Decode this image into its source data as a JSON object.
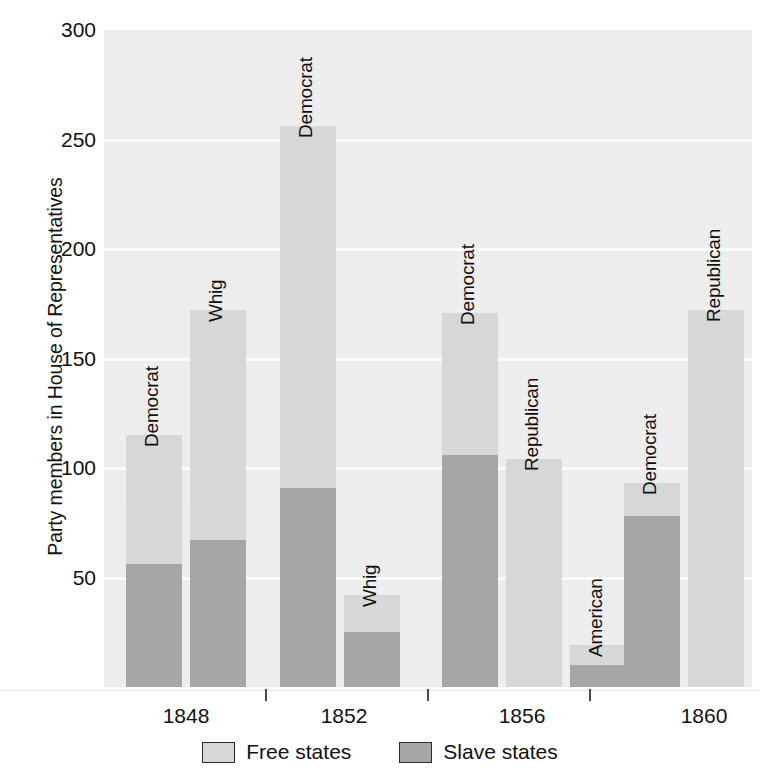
{
  "chart_data": {
    "type": "bar",
    "subtype": "stacked-grouped",
    "title": "",
    "xlabel": "",
    "ylabel": "Party members in House of Representatives",
    "ylim": [
      0,
      300
    ],
    "yticks": [
      50,
      100,
      150,
      200,
      250,
      300
    ],
    "ytick_labels": [
      "50",
      "100",
      "150",
      "200",
      "250",
      "300"
    ],
    "grid": true,
    "grid_axis": "y",
    "categories": [
      "1848",
      "1852",
      "1856",
      "1860"
    ],
    "series": [
      {
        "name": "Free states",
        "color": "#d7d7d7"
      },
      {
        "name": "Slave states",
        "color": "#a6a6a6"
      }
    ],
    "legend_position": "bottom",
    "groups": [
      {
        "category": "1848",
        "bars": [
          {
            "label": "Democrat",
            "free": 59,
            "slave": 56,
            "total": 115
          },
          {
            "label": "Whig",
            "free": 105,
            "slave": 67,
            "total": 172
          }
        ]
      },
      {
        "category": "1852",
        "bars": [
          {
            "label": "Democrat",
            "free": 165,
            "slave": 91,
            "total": 256
          },
          {
            "label": "Whig",
            "free": 17,
            "slave": 25,
            "total": 42
          }
        ]
      },
      {
        "category": "1856",
        "bars": [
          {
            "label": "Democrat",
            "free": 65,
            "slave": 106,
            "total": 171
          },
          {
            "label": "Republican",
            "free": 104,
            "slave": 0,
            "total": 104
          },
          {
            "label": "American",
            "free": 9,
            "slave": 10,
            "total": 19
          }
        ]
      },
      {
        "category": "1860",
        "bars": [
          {
            "label": "Democrat",
            "free": 15,
            "slave": 78,
            "total": 93
          },
          {
            "label": "Republican",
            "free": 172,
            "slave": 0,
            "total": 172
          }
        ]
      }
    ]
  },
  "axis": {
    "y_title": "Party members in House of Representatives",
    "y_tick_labels": [
      "300",
      "250",
      "200",
      "150",
      "100",
      "50"
    ],
    "x_tick_labels": [
      "1848",
      "1852",
      "1856",
      "1860"
    ]
  },
  "legend": {
    "items": [
      {
        "label": "Free states",
        "color": "#d7d7d7"
      },
      {
        "label": "Slave states",
        "color": "#a6a6a6"
      }
    ]
  }
}
